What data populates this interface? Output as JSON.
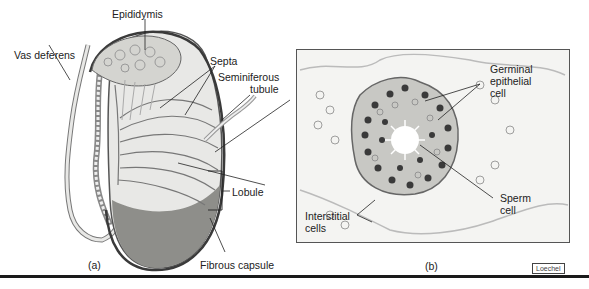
{
  "figure": {
    "panel_a": {
      "caption": "(a)",
      "labels": {
        "epididymis": "Epididymis",
        "vas_deferens": "Vas deferens",
        "septa": "Septa",
        "seminiferous_tubule_1": "Seminiferous",
        "seminiferous_tubule_2": "tubule",
        "lobule": "Lobule",
        "fibrous_capsule": "Fibrous capsule"
      }
    },
    "panel_b": {
      "caption": "(b)",
      "labels": {
        "germinal_1": "Germinal",
        "germinal_2": "epithelial",
        "germinal_3": "cell",
        "sperm_1": "Sperm",
        "sperm_2": "cell",
        "interstitial_1": "Interstitial",
        "interstitial_2": "cells"
      }
    },
    "credit": "Loechel"
  },
  "colors": {
    "outline": "#444444",
    "capsule": "#3a3a3a",
    "tissue": "#d8d8d4",
    "lower_testis": "#8e8e8a",
    "nuclei_dark": "#3a3a3a",
    "box_bg": "#f4f4f2"
  }
}
